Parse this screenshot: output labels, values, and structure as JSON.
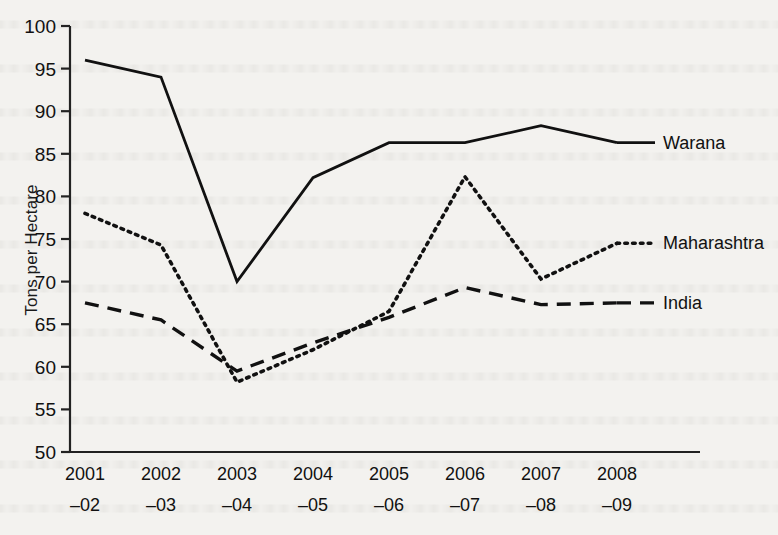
{
  "chart_data": {
    "type": "line",
    "title": "",
    "xlabel": "",
    "ylabel": "Tons per Hectare",
    "categories": [
      "2001\n–02",
      "2002\n–03",
      "2003\n–04",
      "2004\n–05",
      "2005\n–06",
      "2006\n–07",
      "2007\n–08",
      "2008\n–09"
    ],
    "category_lines": [
      [
        "2001",
        "–02"
      ],
      [
        "2002",
        "–03"
      ],
      [
        "2003",
        "–04"
      ],
      [
        "2004",
        "–05"
      ],
      [
        "2005",
        "–06"
      ],
      [
        "2006",
        "–07"
      ],
      [
        "2007",
        "–08"
      ],
      [
        "2008",
        "–09"
      ]
    ],
    "ylim": [
      50,
      100
    ],
    "yticks": [
      50,
      55,
      60,
      65,
      70,
      75,
      80,
      85,
      90,
      95,
      100
    ],
    "grid": false,
    "legend_position": "right-inline-labels",
    "series": [
      {
        "name": "Warana",
        "style": "solid",
        "color": "#111111",
        "values": [
          96.0,
          94.0,
          70.0,
          82.2,
          86.3,
          86.3,
          88.3,
          86.3
        ]
      },
      {
        "name": "Maharashtra",
        "style": "dotted",
        "color": "#111111",
        "values": [
          78.0,
          74.3,
          58.2,
          62.0,
          66.5,
          82.3,
          70.3,
          74.5
        ]
      },
      {
        "name": "India",
        "style": "dashed",
        "color": "#111111",
        "values": [
          67.5,
          65.5,
          59.5,
          62.8,
          65.8,
          69.3,
          67.3,
          67.5
        ]
      }
    ]
  }
}
